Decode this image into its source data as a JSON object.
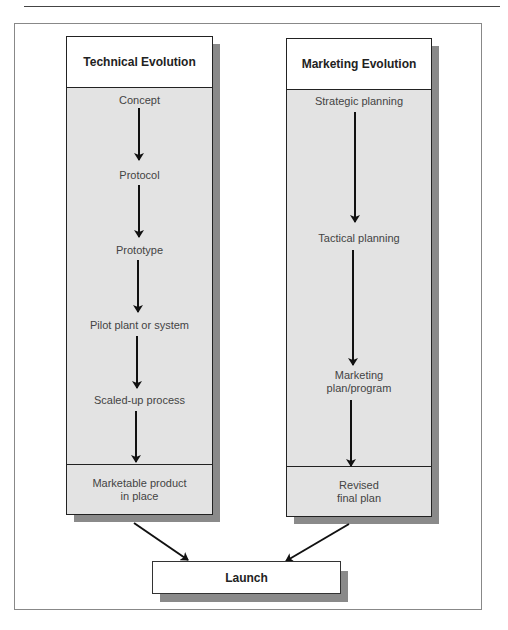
{
  "diagram": {
    "columns": [
      {
        "id": "technical",
        "title": "Technical Evolution",
        "steps": [
          "Concept",
          "Protocol",
          "Prototype",
          "Pilot plant or system",
          "Scaled-up process"
        ],
        "outcome": "Marketable product\nin place"
      },
      {
        "id": "marketing",
        "title": "Marketing Evolution",
        "steps": [
          "Strategic planning",
          "Tactical planning",
          "Marketing\nplan/program"
        ],
        "outcome": "Revised\nfinal plan"
      }
    ],
    "final": {
      "label": "Launch"
    },
    "colors": {
      "box_fill": "#e3e3e3",
      "header_fill": "#ffffff",
      "shadow": "#8a8a8a",
      "stroke": "#222222"
    }
  }
}
